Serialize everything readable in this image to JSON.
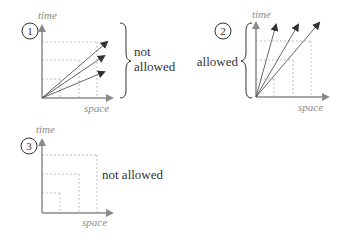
{
  "panels": [
    {
      "number": "1",
      "y_label": "time",
      "x_label": "space",
      "annotation_line1": "not",
      "annotation_line2": "allowed"
    },
    {
      "number": "2",
      "y_label": "time",
      "x_label": "space",
      "annotation": "allowed"
    },
    {
      "number": "3",
      "y_label": "time",
      "x_label": "space",
      "annotation": "not allowed"
    }
  ],
  "colors": {
    "axis": "#8a8a8a",
    "arrow": "#555555",
    "dash": "#b0b0b0",
    "text": "#333333"
  }
}
